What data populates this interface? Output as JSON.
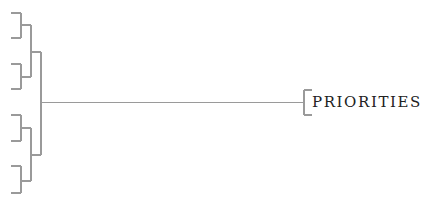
{
  "diagram": {
    "type": "tree",
    "orientation": "right-to-left",
    "line_color": "#9a9a9a",
    "text_color": "#222222",
    "root": {
      "label": "PRIORITIES",
      "children": [
        {
          "label": "",
          "children": [
            {
              "label": "",
              "children": [
                {
                  "label": ""
                },
                {
                  "label": ""
                }
              ]
            },
            {
              "label": "",
              "children": [
                {
                  "label": ""
                },
                {
                  "label": ""
                }
              ]
            }
          ]
        },
        {
          "label": "",
          "children": [
            {
              "label": "",
              "children": [
                {
                  "label": ""
                },
                {
                  "label": ""
                }
              ]
            },
            {
              "label": "",
              "children": [
                {
                  "label": ""
                },
                {
                  "label": ""
                }
              ]
            }
          ]
        }
      ]
    },
    "leaf_count": 8
  }
}
